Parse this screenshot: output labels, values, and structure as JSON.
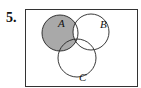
{
  "problem": {
    "number": "5.",
    "sets": [
      {
        "label": "A",
        "cx": 60,
        "cy": 33,
        "r": 18
      },
      {
        "label": "B",
        "cx": 91,
        "cy": 32,
        "r": 18
      },
      {
        "label": "C",
        "cx": 77,
        "cy": 58,
        "r": 19
      }
    ],
    "shaded_region": "A ∩ (B' ∪ C)",
    "shade_color": "#a9a9a9",
    "line_color": "#222222",
    "frame": {
      "x": 25,
      "y": 9,
      "width": 113,
      "height": 78
    }
  }
}
